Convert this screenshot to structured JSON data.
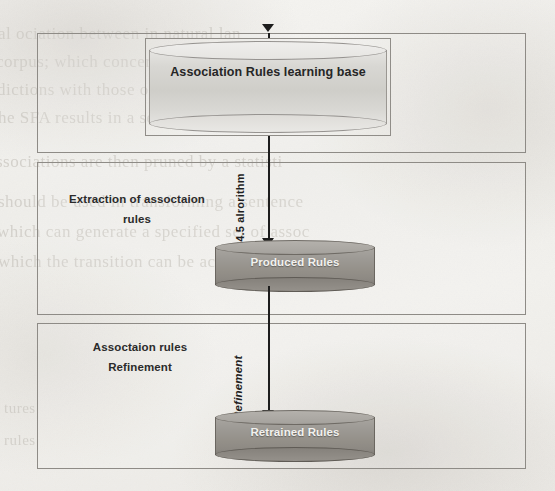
{
  "diagram": {
    "sections": [
      {
        "id": "learning-base",
        "label": ""
      },
      {
        "id": "extraction",
        "label": "Extraction of assoctaion\nrules"
      },
      {
        "id": "refinement",
        "label": "Assoctaion rules\nRefinement"
      }
    ],
    "section_labels": {
      "extraction_line1": "Extraction of assoctaion",
      "extraction_line2": "rules",
      "refinement_line1": "Assoctaion rules",
      "refinement_line2": "Refinement"
    },
    "nodes": [
      {
        "id": "learning-base",
        "label": "Association Rules learning base",
        "shape": "cylinder",
        "fill": "#d3d2ce",
        "text_color": "#262626"
      },
      {
        "id": "produced-rules",
        "label": "Produced Rules",
        "shape": "cylinder",
        "fill": "#969289",
        "text_color": "#f2f1ee"
      },
      {
        "id": "retrained-rules",
        "label": "Retrained Rules",
        "shape": "cylinder",
        "fill": "#969289",
        "text_color": "#f2f1ee"
      }
    ],
    "edges": [
      {
        "id": "edge-input",
        "from": "",
        "to": "learning-base",
        "label": ""
      },
      {
        "id": "edge-c45",
        "from": "learning-base",
        "to": "produced-rules",
        "label": "C4.5 alrorithm"
      },
      {
        "id": "edge-refine",
        "from": "produced-rules",
        "to": "retrained-rules",
        "label": "Refinement"
      }
    ],
    "colors": {
      "paper": "#f2f1ed",
      "box_border": "#8e8b86",
      "arrow": "#1d1d1d",
      "bleed_text": "#cfccc6"
    }
  },
  "bleed_through": {
    "lines": [
      "al   ociation between in natural lan",
      "corpus;  which concerns  combining  proba",
      "dictions  with   those   of   a   probabili",
      "he SFA  results  in a set of increased  probab",
      "ssociations  are  then  pruned   by  a   statisti",
      "should be used in  transforming   a sentence",
      "which can generate  a  specified   set  of  assoc",
      "which the  transition   can   be   achieved.",
      "tures",
      "rules"
    ]
  }
}
